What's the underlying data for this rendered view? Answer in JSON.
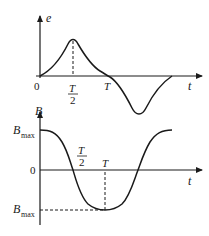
{
  "figure": {
    "top_graph": {
      "y_axis_label": "e",
      "x_axis_label": "t",
      "origin_label": "0",
      "tick_half_label": {
        "numerator": "T",
        "denominator": "2"
      },
      "tick_T_label": "T",
      "description": "Induced EMF e vs time: rises from 0 to a positive peak at T/2, returns to 0 at T, then a symmetric negative trough between T and 3T/2-ish, returning to 0."
    },
    "bottom_graph": {
      "y_axis_label": "B",
      "x_axis_label": "t",
      "origin_label": "0",
      "ymax_label": {
        "main": "B",
        "sub": "max"
      },
      "ymin_label": {
        "main": "B",
        "sub": "max"
      },
      "tick_half_label": {
        "numerator": "T",
        "denominator": "2"
      },
      "tick_T_label": "T",
      "description": "Magnetic field B vs time: cosine-like, starts at Bmax, crosses 0 at T/2, minimum (-Bmax) at T, returns to Bmax."
    },
    "colors": {
      "stroke": "#1a1a1a",
      "background": "#ffffff"
    }
  }
}
